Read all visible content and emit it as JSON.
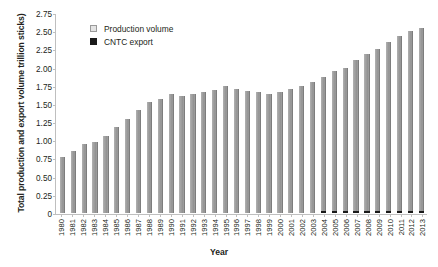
{
  "chart_data": {
    "type": "bar",
    "title": "",
    "xlabel": "Year",
    "ylabel": "Total production and export volume trillion sticks)",
    "ylim": [
      0,
      2.75
    ],
    "yticks": [
      "0",
      "0.25",
      "0.50",
      "0.75",
      "1.00",
      "1.25",
      "1.50",
      "1.75",
      "2.00",
      "2.25",
      "2.50",
      "2.75"
    ],
    "ytick_values": [
      0,
      0.25,
      0.5,
      0.75,
      1.0,
      1.25,
      1.5,
      1.75,
      2.0,
      2.25,
      2.5,
      2.75
    ],
    "grid": false,
    "legend_position": "top-left",
    "categories": [
      "1980",
      "1981",
      "1982",
      "1983",
      "1984",
      "1985",
      "1986",
      "1987",
      "1988",
      "1989",
      "1990",
      "1991",
      "1992",
      "1993",
      "1994",
      "1995",
      "1996",
      "1997",
      "1998",
      "1999",
      "2000",
      "2001",
      "2002",
      "2003",
      "2004",
      "2005",
      "2006",
      "2007",
      "2008",
      "2009",
      "2010",
      "2011",
      "2012",
      "2013"
    ],
    "series": [
      {
        "name": "Production volume",
        "color": "#9d9d9d",
        "values": [
          0.77,
          0.85,
          0.95,
          0.97,
          1.06,
          1.18,
          1.29,
          1.42,
          1.52,
          1.57,
          1.63,
          1.61,
          1.64,
          1.66,
          1.69,
          1.74,
          1.7,
          1.68,
          1.66,
          1.64,
          1.67,
          1.71,
          1.75,
          1.8,
          1.87,
          1.95,
          2.0,
          2.1,
          2.18,
          2.26,
          2.35,
          2.43,
          2.5,
          2.55
        ]
      },
      {
        "name": "CNTC export",
        "color": "#1a1a1a",
        "values": [
          0,
          0,
          0,
          0,
          0,
          0,
          0,
          0,
          0,
          0,
          0,
          0,
          0,
          0,
          0,
          0,
          0,
          0,
          0,
          0,
          0,
          0,
          0,
          0,
          0.02,
          0.02,
          0.025,
          0.02,
          0.02,
          0.02,
          0.025,
          0.025,
          0.02,
          0.03
        ]
      }
    ]
  }
}
